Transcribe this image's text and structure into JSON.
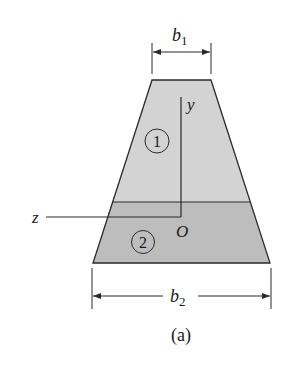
{
  "figure": {
    "caption": "(a)",
    "colors": {
      "region1_fill": "#d3d3d3",
      "region2_fill": "#bdbdbd",
      "stroke": "#2a2a2a"
    },
    "dimensions": {
      "top_width": {
        "symbol": "b",
        "subscript": "1"
      },
      "bottom_width": {
        "symbol": "b",
        "subscript": "2"
      }
    },
    "axes": {
      "y_label": "y",
      "z_label": "z",
      "origin_label": "O"
    },
    "regions": [
      {
        "id": "1",
        "label": "1"
      },
      {
        "id": "2",
        "label": "2"
      }
    ]
  }
}
